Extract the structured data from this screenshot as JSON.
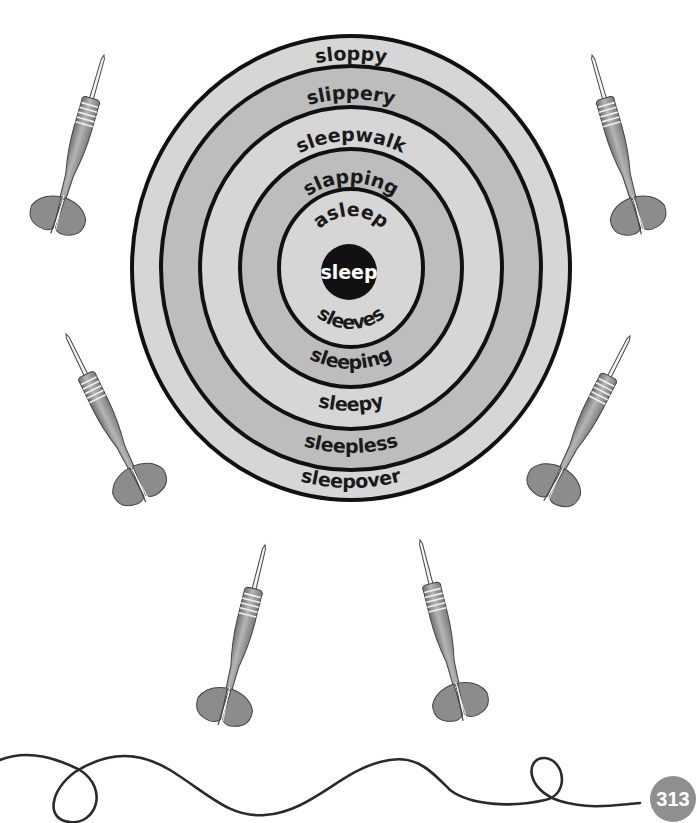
{
  "page": {
    "page_number": "313",
    "background": "#ffffff"
  },
  "dartboard": {
    "center_word": "sleep",
    "colors": {
      "ring_light": "#d6d6d6",
      "ring_dark": "#bdbdbd",
      "ring_line": "#111111",
      "bullseye": "#111111",
      "bullseye_text": "#ffffff"
    },
    "top_words": [
      "sloppy",
      "slippery",
      "sleepwalk",
      "slapping",
      "asleep"
    ],
    "bottom_words": [
      "sleepover",
      "sleepless",
      "sleepy",
      "sleeping",
      "sleeves"
    ]
  },
  "darts": {
    "count": 8,
    "color": "#8c8c8c",
    "positions": [
      "top-left",
      "top-right",
      "middle-left",
      "middle-right",
      "bottom-left",
      "bottom-right"
    ]
  },
  "decoration": {
    "squiggle_line_color": "#2a2a2a",
    "page_badge_color": "#8f8f8f"
  }
}
